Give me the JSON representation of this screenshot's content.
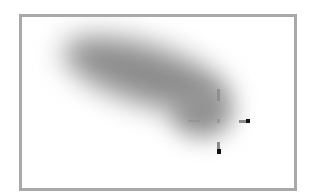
{
  "figure": {
    "frame_color": "#a9a9a9",
    "blob_color": "#8c8c8c",
    "marker": {
      "type": "crosshair",
      "center": [
        218,
        121
      ],
      "tip_color": "#111111"
    }
  }
}
